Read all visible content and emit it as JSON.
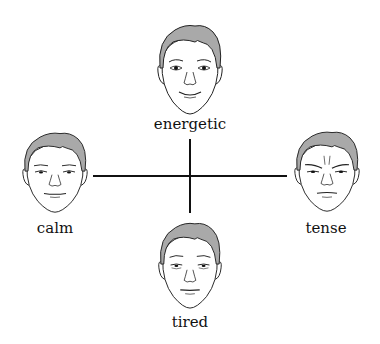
{
  "diagram": {
    "type": "mood quadrant with four faces",
    "axes": {
      "vertical": {
        "top": "energetic",
        "bottom": "tired"
      },
      "horizontal": {
        "left": "calm",
        "right": "tense"
      },
      "line_color": "#111111"
    },
    "faces": [
      {
        "id": "top",
        "label": "energetic",
        "expression": "energetic-icon"
      },
      {
        "id": "left",
        "label": "calm",
        "expression": "calm-icon"
      },
      {
        "id": "right",
        "label": "tense",
        "expression": "tense-icon"
      },
      {
        "id": "bottom",
        "label": "tired",
        "expression": "tired-icon"
      }
    ],
    "colors": {
      "hair": "#a9a9a9",
      "skin": "#ffffff",
      "outline": "#222222"
    }
  }
}
